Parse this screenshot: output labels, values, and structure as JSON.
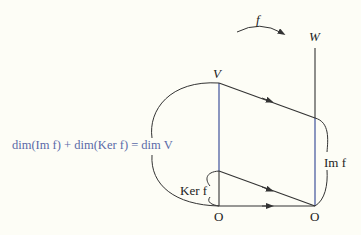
{
  "labels": {
    "f": "f",
    "W": "W",
    "V": "V",
    "equation": "dim(Im f) + dim(Ker f) = dim V",
    "im_f": "Im f",
    "ker_f": "Ker f",
    "origin_left": "O",
    "origin_right": "O"
  },
  "colors": {
    "line": "#333333",
    "subspace": "#5a6aa8",
    "equation": "#5a6aa8",
    "background": "#fdfdf6"
  }
}
